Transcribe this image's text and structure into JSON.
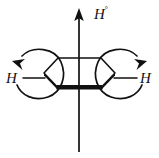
{
  "figure": {
    "background_color": "#ffffff",
    "stroke_color": "#111111",
    "labels": {
      "top_hydrogen": "H",
      "top_hydrogen_superscript": "°",
      "left_hydrogen": "H",
      "right_hydrogen": "H"
    },
    "elements": {
      "ring_name": "cyclohexane-ring",
      "bold_front_edge": "bold-front-bond",
      "axial_arrow": "axial-up-arrow",
      "axial_line_down": "axial-down-line",
      "left_curved_arrow": "left-rotation-arrow",
      "right_curved_arrow": "right-rotation-arrow",
      "left_bond": "left-hydrogen-bond",
      "right_bond": "right-hydrogen-bond"
    }
  }
}
